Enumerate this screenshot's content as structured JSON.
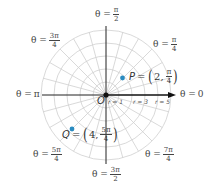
{
  "diagram": {
    "type": "polar_coordinate_grid",
    "origin_label": "O",
    "rings": 5,
    "spoke_step_degrees": 15,
    "grid_color": "#cfcfcf",
    "axis_color": "#222222",
    "point_color": "#2a8bc0",
    "angle_labels": {
      "theta_0": {
        "prefix": "θ =",
        "value": "0"
      },
      "theta_pi_4": {
        "prefix": "θ =",
        "num": "π",
        "den": "4"
      },
      "theta_pi_2": {
        "prefix": "θ =",
        "num": "π",
        "den": "2"
      },
      "theta_3pi_4": {
        "prefix": "θ =",
        "num": "3π",
        "den": "4"
      },
      "theta_pi": {
        "prefix": "θ =",
        "value": "π"
      },
      "theta_5pi_4": {
        "prefix": "θ =",
        "num": "5π",
        "den": "4"
      },
      "theta_3pi_2": {
        "prefix": "θ =",
        "num": "3π",
        "den": "2"
      },
      "theta_7pi_4": {
        "prefix": "θ =",
        "num": "7π",
        "den": "4"
      }
    },
    "radius_labels": [
      "r = 1",
      "r = 3",
      "r = 5"
    ],
    "points": [
      {
        "name": "P",
        "eq": "=",
        "r": "2",
        "theta_num": "π",
        "theta_den": "4"
      },
      {
        "name": "Q",
        "eq": "=",
        "r": "4",
        "theta_num": "5π",
        "theta_den": "4"
      }
    ]
  }
}
